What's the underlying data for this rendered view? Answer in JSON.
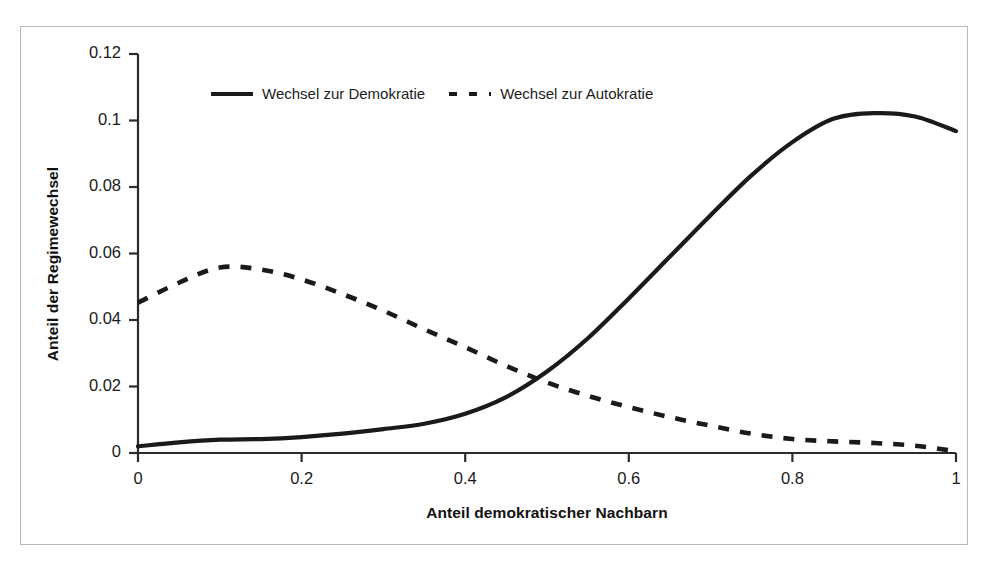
{
  "chart_data": {
    "type": "line",
    "title": "",
    "xlabel": "Anteil demokratischer Nachbarn",
    "ylabel": "Anteil der Regimewechsel",
    "xlim": [
      0,
      1
    ],
    "ylim": [
      0,
      0.12
    ],
    "xticks": [
      "0",
      "0.2",
      "0.4",
      "0.6",
      "0.8",
      "1"
    ],
    "xtick_values": [
      0,
      0.2,
      0.4,
      0.6,
      0.8,
      1
    ],
    "yticks": [
      "0",
      "0.02",
      "0.04",
      "0.06",
      "0.08",
      "0.1",
      "0.12"
    ],
    "ytick_values": [
      0,
      0.02,
      0.04,
      0.06,
      0.08,
      0.1,
      0.12
    ],
    "grid": false,
    "legend_position": "top-center",
    "x": [
      0,
      0.05,
      0.1,
      0.15,
      0.2,
      0.25,
      0.3,
      0.35,
      0.4,
      0.45,
      0.5,
      0.55,
      0.6,
      0.65,
      0.7,
      0.75,
      0.8,
      0.85,
      0.9,
      0.95,
      1
    ],
    "series": [
      {
        "name": "Wechsel zur Demokratie",
        "style": "solid",
        "color": "#1a1a1a",
        "values": [
          0.002,
          0.0032,
          0.004,
          0.0042,
          0.0048,
          0.0058,
          0.0072,
          0.0088,
          0.0118,
          0.0168,
          0.0245,
          0.0345,
          0.0465,
          0.059,
          0.0715,
          0.0835,
          0.0935,
          0.1005,
          0.1022,
          0.1012,
          0.0968
        ]
      },
      {
        "name": "Wechsel zur Autokratie",
        "style": "dashed",
        "color": "#1a1a1a",
        "values": [
          0.0452,
          0.0512,
          0.0558,
          0.0552,
          0.0522,
          0.0478,
          0.0428,
          0.0372,
          0.0318,
          0.0262,
          0.0212,
          0.0172,
          0.0138,
          0.0108,
          0.0082,
          0.0058,
          0.0042,
          0.0035,
          0.003,
          0.0022,
          0.0005
        ]
      }
    ],
    "annotations": []
  },
  "legend": {
    "entries": [
      {
        "label": "Wechsel zur Demokratie",
        "style": "solid"
      },
      {
        "label": "Wechsel zur Autokratie",
        "style": "dashed"
      }
    ]
  },
  "colors": {
    "line": "#1a1a1a",
    "axis": "#2b2b2b",
    "frame": "#b9b9b9",
    "background": "#ffffff"
  }
}
